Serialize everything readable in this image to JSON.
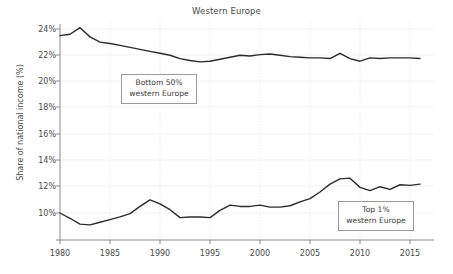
{
  "chart_data": {
    "type": "line",
    "title": "Western Europe",
    "xlabel": "",
    "ylabel": "Share of national income (%)",
    "xlim": [
      1980,
      2017
    ],
    "ylim": [
      8.6,
      24.6
    ],
    "grid": true,
    "legend_position": "inline-annotations",
    "x_ticks": [
      "1980",
      "1985",
      "1990",
      "1995",
      "2000",
      "2005",
      "2010",
      "2015"
    ],
    "y_ticks": [
      "10%",
      "12%",
      "14%",
      "16%",
      "18%",
      "20%",
      "22%",
      "24%"
    ],
    "x": [
      1980,
      1981,
      1982,
      1983,
      1984,
      1985,
      1986,
      1987,
      1988,
      1989,
      1990,
      1991,
      1992,
      1993,
      1994,
      1995,
      1996,
      1997,
      1998,
      1999,
      2000,
      2001,
      2002,
      2003,
      2004,
      2005,
      2006,
      2007,
      2008,
      2009,
      2010,
      2011,
      2012,
      2013,
      2014,
      2015,
      2016
    ],
    "series": [
      {
        "name": "Bottom 50% western Europe",
        "color": "#2b2b2b",
        "values": [
          23.5,
          23.6,
          24.1,
          23.4,
          23.0,
          22.9,
          22.75,
          22.6,
          22.45,
          22.3,
          22.15,
          22.0,
          21.75,
          21.6,
          21.5,
          21.55,
          21.7,
          21.85,
          22.0,
          21.95,
          22.05,
          22.1,
          22.0,
          21.9,
          21.85,
          21.8,
          21.8,
          21.75,
          22.15,
          21.75,
          21.55,
          21.8,
          21.75,
          21.8,
          21.8,
          21.8,
          21.75
        ]
      },
      {
        "name": "Top 1% western Europe",
        "color": "#2b2b2b",
        "values": [
          10.0,
          9.6,
          9.15,
          9.1,
          9.3,
          9.5,
          9.7,
          9.95,
          10.5,
          11.0,
          10.7,
          10.25,
          9.65,
          9.7,
          9.7,
          9.65,
          10.2,
          10.6,
          10.5,
          10.5,
          10.6,
          10.45,
          10.45,
          10.55,
          10.85,
          11.1,
          11.6,
          12.2,
          12.6,
          12.65,
          11.95,
          11.7,
          12.0,
          11.8,
          12.15,
          12.1,
          12.2
        ]
      }
    ],
    "annotations": [
      {
        "name": "bottom-50-annotation",
        "line1": "Bottom 50%",
        "line2": "western Europe"
      },
      {
        "name": "top-1-annotation",
        "line1": "Top 1%",
        "line2": "western Europe"
      }
    ]
  }
}
